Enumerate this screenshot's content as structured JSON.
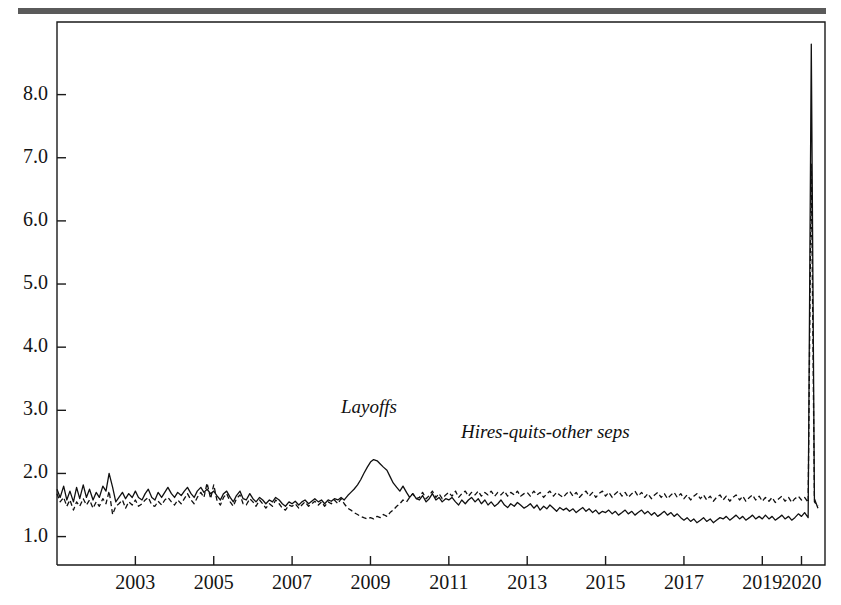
{
  "figure": {
    "rule_color": "#5a5a5a",
    "background": "#ffffff"
  },
  "labels": {
    "layoffs": "Layoffs",
    "hires_quits_other": "Hires-quits-other seps"
  },
  "chart_data": {
    "type": "line",
    "title": "",
    "subtitle": "",
    "xlabel": "",
    "ylabel": "",
    "grid": false,
    "legend_position": "inline-annotation",
    "xlim": [
      2001.0,
      2020.6
    ],
    "ylim": [
      0.55,
      9.15
    ],
    "yticks": [
      1.0,
      2.0,
      3.0,
      4.0,
      5.0,
      6.0,
      7.0,
      8.0
    ],
    "ytick_labels": [
      "1.0",
      "2.0",
      "3.0",
      "4.0",
      "5.0",
      "6.0",
      "7.0",
      "8.0"
    ],
    "xticks": [
      2003,
      2005,
      2007,
      2009,
      2011,
      2013,
      2015,
      2017,
      2019,
      2020
    ],
    "xtick_labels": [
      "2003",
      "2005",
      "2007",
      "2009",
      "2011",
      "2013",
      "2015",
      "2017",
      "2019",
      "2020"
    ],
    "line_color": "#101010",
    "series": [
      {
        "name": "Layoffs",
        "style": "solid",
        "x": [
          2001.0,
          2001.08,
          2001.17,
          2001.25,
          2001.33,
          2001.42,
          2001.5,
          2001.58,
          2001.67,
          2001.75,
          2001.83,
          2001.92,
          2002.0,
          2002.08,
          2002.17,
          2002.25,
          2002.33,
          2002.42,
          2002.5,
          2002.58,
          2002.67,
          2002.75,
          2002.83,
          2002.92,
          2003.0,
          2003.08,
          2003.17,
          2003.25,
          2003.33,
          2003.42,
          2003.5,
          2003.58,
          2003.67,
          2003.75,
          2003.83,
          2003.92,
          2004.0,
          2004.08,
          2004.17,
          2004.25,
          2004.33,
          2004.42,
          2004.5,
          2004.58,
          2004.67,
          2004.75,
          2004.83,
          2004.92,
          2005.0,
          2005.08,
          2005.17,
          2005.25,
          2005.33,
          2005.42,
          2005.5,
          2005.58,
          2005.67,
          2005.75,
          2005.83,
          2005.92,
          2006.0,
          2006.08,
          2006.17,
          2006.25,
          2006.33,
          2006.42,
          2006.5,
          2006.58,
          2006.67,
          2006.75,
          2006.83,
          2006.92,
          2007.0,
          2007.08,
          2007.17,
          2007.25,
          2007.33,
          2007.42,
          2007.5,
          2007.58,
          2007.67,
          2007.75,
          2007.83,
          2007.92,
          2008.0,
          2008.08,
          2008.17,
          2008.25,
          2008.33,
          2008.42,
          2008.5,
          2008.58,
          2008.67,
          2008.75,
          2008.83,
          2008.92,
          2009.0,
          2009.08,
          2009.17,
          2009.25,
          2009.33,
          2009.42,
          2009.5,
          2009.58,
          2009.67,
          2009.75,
          2009.83,
          2009.92,
          2010.0,
          2010.08,
          2010.17,
          2010.25,
          2010.33,
          2010.42,
          2010.5,
          2010.58,
          2010.67,
          2010.75,
          2010.83,
          2010.92,
          2011.0,
          2011.08,
          2011.17,
          2011.25,
          2011.33,
          2011.42,
          2011.5,
          2011.58,
          2011.67,
          2011.75,
          2011.83,
          2011.92,
          2012.0,
          2012.08,
          2012.17,
          2012.25,
          2012.33,
          2012.42,
          2012.5,
          2012.58,
          2012.67,
          2012.75,
          2012.83,
          2012.92,
          2013.0,
          2013.08,
          2013.17,
          2013.25,
          2013.33,
          2013.42,
          2013.5,
          2013.58,
          2013.67,
          2013.75,
          2013.83,
          2013.92,
          2014.0,
          2014.08,
          2014.17,
          2014.25,
          2014.33,
          2014.42,
          2014.5,
          2014.58,
          2014.67,
          2014.75,
          2014.83,
          2014.92,
          2015.0,
          2015.08,
          2015.17,
          2015.25,
          2015.33,
          2015.42,
          2015.5,
          2015.58,
          2015.67,
          2015.75,
          2015.83,
          2015.92,
          2016.0,
          2016.08,
          2016.17,
          2016.25,
          2016.33,
          2016.42,
          2016.5,
          2016.58,
          2016.67,
          2016.75,
          2016.83,
          2016.92,
          2017.0,
          2017.08,
          2017.17,
          2017.25,
          2017.33,
          2017.42,
          2017.5,
          2017.58,
          2017.67,
          2017.75,
          2017.83,
          2017.92,
          2018.0,
          2018.08,
          2018.17,
          2018.25,
          2018.33,
          2018.42,
          2018.5,
          2018.58,
          2018.67,
          2018.75,
          2018.83,
          2018.92,
          2019.0,
          2019.08,
          2019.17,
          2019.25,
          2019.33,
          2019.42,
          2019.5,
          2019.58,
          2019.67,
          2019.75,
          2019.83,
          2019.92,
          2020.0,
          2020.08,
          2020.17,
          2020.25,
          2020.33,
          2020.42
        ],
        "values": [
          1.75,
          1.62,
          1.8,
          1.58,
          1.72,
          1.55,
          1.78,
          1.6,
          1.82,
          1.62,
          1.75,
          1.58,
          1.7,
          1.62,
          1.8,
          1.72,
          2.0,
          1.78,
          1.55,
          1.62,
          1.7,
          1.6,
          1.68,
          1.62,
          1.72,
          1.62,
          1.58,
          1.68,
          1.75,
          1.62,
          1.58,
          1.7,
          1.62,
          1.7,
          1.78,
          1.68,
          1.62,
          1.7,
          1.65,
          1.72,
          1.78,
          1.68,
          1.62,
          1.72,
          1.78,
          1.7,
          1.75,
          1.68,
          1.72,
          1.65,
          1.58,
          1.68,
          1.72,
          1.62,
          1.55,
          1.65,
          1.72,
          1.6,
          1.58,
          1.68,
          1.6,
          1.55,
          1.62,
          1.58,
          1.52,
          1.58,
          1.55,
          1.62,
          1.58,
          1.52,
          1.48,
          1.55,
          1.52,
          1.56,
          1.5,
          1.55,
          1.58,
          1.52,
          1.56,
          1.6,
          1.55,
          1.58,
          1.52,
          1.58,
          1.56,
          1.6,
          1.58,
          1.62,
          1.58,
          1.65,
          1.7,
          1.75,
          1.82,
          1.9,
          2.0,
          2.1,
          2.18,
          2.22,
          2.2,
          2.15,
          2.1,
          2.05,
          1.95,
          1.85,
          1.78,
          1.72,
          1.8,
          1.7,
          1.62,
          1.68,
          1.6,
          1.58,
          1.65,
          1.55,
          1.6,
          1.68,
          1.58,
          1.62,
          1.55,
          1.6,
          1.58,
          1.62,
          1.55,
          1.5,
          1.58,
          1.52,
          1.58,
          1.62,
          1.55,
          1.6,
          1.52,
          1.58,
          1.5,
          1.55,
          1.48,
          1.52,
          1.58,
          1.5,
          1.46,
          1.52,
          1.48,
          1.54,
          1.5,
          1.45,
          1.48,
          1.52,
          1.45,
          1.5,
          1.42,
          1.48,
          1.44,
          1.5,
          1.45,
          1.4,
          1.46,
          1.42,
          1.45,
          1.4,
          1.44,
          1.38,
          1.42,
          1.46,
          1.4,
          1.44,
          1.38,
          1.42,
          1.36,
          1.4,
          1.38,
          1.42,
          1.36,
          1.4,
          1.34,
          1.38,
          1.42,
          1.36,
          1.4,
          1.34,
          1.38,
          1.42,
          1.36,
          1.4,
          1.34,
          1.38,
          1.32,
          1.36,
          1.4,
          1.34,
          1.38,
          1.32,
          1.36,
          1.3,
          1.26,
          1.3,
          1.24,
          1.28,
          1.22,
          1.26,
          1.3,
          1.24,
          1.28,
          1.22,
          1.26,
          1.3,
          1.28,
          1.32,
          1.26,
          1.3,
          1.34,
          1.28,
          1.32,
          1.26,
          1.3,
          1.34,
          1.28,
          1.32,
          1.28,
          1.34,
          1.28,
          1.32,
          1.26,
          1.3,
          1.34,
          1.28,
          1.32,
          1.26,
          1.3,
          1.36,
          1.32,
          1.38,
          1.3,
          8.8,
          1.6,
          1.45
        ]
      },
      {
        "name": "Hires-quits-other seps",
        "style": "dashed",
        "x": [
          2001.0,
          2001.08,
          2001.17,
          2001.25,
          2001.33,
          2001.42,
          2001.5,
          2001.58,
          2001.67,
          2001.75,
          2001.83,
          2001.92,
          2002.0,
          2002.08,
          2002.17,
          2002.25,
          2002.33,
          2002.42,
          2002.5,
          2002.58,
          2002.67,
          2002.75,
          2002.83,
          2002.92,
          2003.0,
          2003.08,
          2003.17,
          2003.25,
          2003.33,
          2003.42,
          2003.5,
          2003.58,
          2003.67,
          2003.75,
          2003.83,
          2003.92,
          2004.0,
          2004.08,
          2004.17,
          2004.25,
          2004.33,
          2004.42,
          2004.5,
          2004.58,
          2004.67,
          2004.75,
          2004.83,
          2004.92,
          2005.0,
          2005.08,
          2005.17,
          2005.25,
          2005.33,
          2005.42,
          2005.5,
          2005.58,
          2005.67,
          2005.75,
          2005.83,
          2005.92,
          2006.0,
          2006.08,
          2006.17,
          2006.25,
          2006.33,
          2006.42,
          2006.5,
          2006.58,
          2006.67,
          2006.75,
          2006.83,
          2006.92,
          2007.0,
          2007.08,
          2007.17,
          2007.25,
          2007.33,
          2007.42,
          2007.5,
          2007.58,
          2007.67,
          2007.75,
          2007.83,
          2007.92,
          2008.0,
          2008.08,
          2008.17,
          2008.25,
          2008.33,
          2008.42,
          2008.5,
          2008.58,
          2008.67,
          2008.75,
          2008.83,
          2008.92,
          2009.0,
          2009.08,
          2009.17,
          2009.25,
          2009.33,
          2009.42,
          2009.5,
          2009.58,
          2009.67,
          2009.75,
          2009.83,
          2009.92,
          2010.0,
          2010.08,
          2010.17,
          2010.25,
          2010.33,
          2010.42,
          2010.5,
          2010.58,
          2010.67,
          2010.75,
          2010.83,
          2010.92,
          2011.0,
          2011.08,
          2011.17,
          2011.25,
          2011.33,
          2011.42,
          2011.5,
          2011.58,
          2011.67,
          2011.75,
          2011.83,
          2011.92,
          2012.0,
          2012.08,
          2012.17,
          2012.25,
          2012.33,
          2012.42,
          2012.5,
          2012.58,
          2012.67,
          2012.75,
          2012.83,
          2012.92,
          2013.0,
          2013.08,
          2013.17,
          2013.25,
          2013.33,
          2013.42,
          2013.5,
          2013.58,
          2013.67,
          2013.75,
          2013.83,
          2013.92,
          2014.0,
          2014.08,
          2014.17,
          2014.25,
          2014.33,
          2014.42,
          2014.5,
          2014.58,
          2014.67,
          2014.75,
          2014.83,
          2014.92,
          2015.0,
          2015.08,
          2015.17,
          2015.25,
          2015.33,
          2015.42,
          2015.5,
          2015.58,
          2015.67,
          2015.75,
          2015.83,
          2015.92,
          2016.0,
          2016.08,
          2016.17,
          2016.25,
          2016.33,
          2016.42,
          2016.5,
          2016.58,
          2016.67,
          2016.75,
          2016.83,
          2016.92,
          2017.0,
          2017.08,
          2017.17,
          2017.25,
          2017.33,
          2017.42,
          2017.5,
          2017.58,
          2017.67,
          2017.75,
          2017.83,
          2017.92,
          2018.0,
          2018.08,
          2018.17,
          2018.25,
          2018.33,
          2018.42,
          2018.5,
          2018.58,
          2018.67,
          2018.75,
          2018.83,
          2018.92,
          2019.0,
          2019.08,
          2019.17,
          2019.25,
          2019.33,
          2019.42,
          2019.5,
          2019.58,
          2019.67,
          2019.75,
          2019.83,
          2019.92,
          2020.0,
          2020.08,
          2020.17,
          2020.25,
          2020.33,
          2020.42
        ],
        "values": [
          1.68,
          1.55,
          1.62,
          1.48,
          1.58,
          1.42,
          1.55,
          1.48,
          1.6,
          1.5,
          1.58,
          1.45,
          1.55,
          1.48,
          1.6,
          1.52,
          1.72,
          1.35,
          1.48,
          1.52,
          1.58,
          1.45,
          1.55,
          1.5,
          1.58,
          1.48,
          1.52,
          1.58,
          1.62,
          1.5,
          1.48,
          1.56,
          1.5,
          1.58,
          1.62,
          1.55,
          1.5,
          1.58,
          1.52,
          1.6,
          1.68,
          1.58,
          1.52,
          1.62,
          1.7,
          1.62,
          1.85,
          1.6,
          1.82,
          1.58,
          1.5,
          1.62,
          1.68,
          1.55,
          1.48,
          1.6,
          1.66,
          1.52,
          1.5,
          1.6,
          1.55,
          1.48,
          1.58,
          1.52,
          1.45,
          1.52,
          1.48,
          1.58,
          1.52,
          1.45,
          1.42,
          1.5,
          1.48,
          1.52,
          1.45,
          1.5,
          1.55,
          1.48,
          1.52,
          1.56,
          1.5,
          1.55,
          1.48,
          1.55,
          1.52,
          1.58,
          1.52,
          1.6,
          1.52,
          1.45,
          1.42,
          1.38,
          1.35,
          1.32,
          1.3,
          1.28,
          1.3,
          1.28,
          1.32,
          1.3,
          1.35,
          1.32,
          1.38,
          1.42,
          1.48,
          1.52,
          1.58,
          1.55,
          1.62,
          1.68,
          1.6,
          1.62,
          1.7,
          1.6,
          1.65,
          1.72,
          1.62,
          1.68,
          1.6,
          1.66,
          1.7,
          1.64,
          1.72,
          1.62,
          1.68,
          1.72,
          1.64,
          1.7,
          1.66,
          1.72,
          1.64,
          1.7,
          1.66,
          1.72,
          1.64,
          1.7,
          1.66,
          1.72,
          1.64,
          1.7,
          1.66,
          1.72,
          1.64,
          1.68,
          1.7,
          1.64,
          1.72,
          1.66,
          1.7,
          1.62,
          1.68,
          1.72,
          1.64,
          1.7,
          1.66,
          1.62,
          1.68,
          1.72,
          1.64,
          1.7,
          1.62,
          1.68,
          1.72,
          1.64,
          1.7,
          1.62,
          1.68,
          1.72,
          1.64,
          1.7,
          1.62,
          1.68,
          1.72,
          1.64,
          1.7,
          1.62,
          1.68,
          1.72,
          1.64,
          1.7,
          1.62,
          1.68,
          1.6,
          1.66,
          1.7,
          1.62,
          1.68,
          1.6,
          1.66,
          1.7,
          1.62,
          1.68,
          1.6,
          1.66,
          1.58,
          1.64,
          1.68,
          1.6,
          1.66,
          1.58,
          1.64,
          1.56,
          1.62,
          1.66,
          1.58,
          1.64,
          1.56,
          1.62,
          1.66,
          1.58,
          1.64,
          1.56,
          1.62,
          1.66,
          1.58,
          1.64,
          1.56,
          1.62,
          1.56,
          1.62,
          1.54,
          1.6,
          1.64,
          1.56,
          1.62,
          1.54,
          1.6,
          1.64,
          1.58,
          1.62,
          1.54,
          6.9,
          1.55,
          1.48
        ]
      }
    ]
  }
}
